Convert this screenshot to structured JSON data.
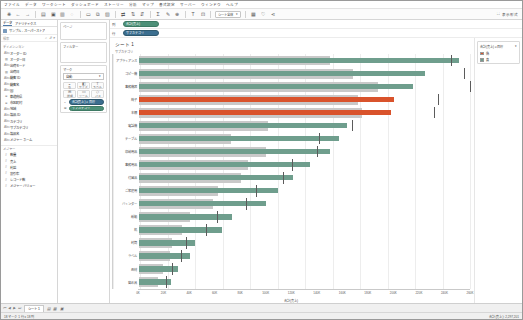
{
  "menu": {
    "items": [
      "ファイル",
      "データ",
      "ワークシート",
      "ダッシュボード",
      "ストーリー",
      "分析",
      "マップ",
      "書式設定",
      "サーバー",
      "ウィンドウ",
      "ヘルプ"
    ]
  },
  "toolbar": {
    "icons": [
      "tableau-logo-icon",
      "back-arrow-icon",
      "forward-arrow-icon",
      "save-icon",
      "add-datasource-icon",
      "refresh-datasource-icon",
      "pause-icon",
      "new-worksheet-icon",
      "duplicate-sheet-icon",
      "clear-sheet-icon",
      "swap-axes-icon",
      "sort-ascending-icon",
      "sort-descending-icon",
      "highlight-icon",
      "group-icon"
    ],
    "fit_label": "シート全体",
    "fit_options": [
      "標準",
      "幅を合わせる",
      "高さを合わせる",
      "シート全体"
    ],
    "presentation_label": "表示形式",
    "presentation_icon": "presentation-icon",
    "share_icon": "share-icon"
  },
  "datapane": {
    "tabs": [
      {
        "label": "データ",
        "active": true
      },
      {
        "label": "アナリティクス",
        "active": false
      }
    ],
    "source_name": "サンプル - スーパーストア",
    "source_icon": "datasource-icon",
    "search_placeholder": "検索",
    "search_icons": [
      "search-icon",
      "sort-field-icon",
      "more-options-icon"
    ],
    "dimensions_header": "ディメンション",
    "dimensions": [
      {
        "icon": "abc",
        "label": "オーダー ID"
      },
      {
        "icon": "cal",
        "label": "オーダー日"
      },
      {
        "icon": "abc",
        "label": "出荷モード"
      },
      {
        "icon": "cal",
        "label": "出荷日"
      },
      {
        "icon": "abc",
        "label": "顧客 ID"
      },
      {
        "icon": "abc",
        "label": "顧客名"
      },
      {
        "icon": "abc",
        "label": "国"
      },
      {
        "icon": "geo",
        "label": "都道府県"
      },
      {
        "icon": "geo",
        "label": "市区町村"
      },
      {
        "icon": "abc",
        "label": "地域"
      },
      {
        "icon": "abc",
        "label": "製品 ID"
      },
      {
        "icon": "abc",
        "label": "カテゴリ"
      },
      {
        "icon": "abc",
        "label": "サブカテゴリ"
      },
      {
        "icon": "abc",
        "label": "製品名"
      },
      {
        "icon": "abc",
        "label": "メジャー ネーム"
      }
    ],
    "measures_header": "メジャー",
    "measures": [
      {
        "icon": "num",
        "label": "数量"
      },
      {
        "icon": "num",
        "label": "売上"
      },
      {
        "icon": "num",
        "label": "利益"
      },
      {
        "icon": "num",
        "label": "割引率"
      },
      {
        "icon": "num",
        "label": "レコード数"
      },
      {
        "icon": "num",
        "label": "メジャー バリュー"
      }
    ]
  },
  "cards": {
    "pages": {
      "title": "ページ"
    },
    "filters": {
      "title": "フィルター"
    },
    "marks": {
      "title": "マーク",
      "type_label": "自動",
      "type_options": [
        "自動",
        "バー",
        "線",
        "エリア",
        "四角",
        "円",
        "形状",
        "テキスト",
        "マップ",
        "円グラフ",
        "ガント チャート",
        "多角形",
        "密度"
      ],
      "buttons": [
        {
          "name": "color-button",
          "glyph": "◒",
          "label": "色"
        },
        {
          "name": "size-button",
          "glyph": "◧",
          "label": "サイズ"
        },
        {
          "name": "label-button",
          "glyph": "T",
          "label": "ラベル"
        },
        {
          "name": "detail-button",
          "glyph": "⊞",
          "label": "詳細"
        },
        {
          "name": "tooltip-button",
          "glyph": "▭",
          "label": "ツール"
        },
        {
          "name": "path-button",
          "glyph": "◇",
          "label": "パス"
        }
      ],
      "pills": [
        {
          "placeholder_icon": "color-icon",
          "label": "合計(売上) ≥ 目標",
          "color": "blue"
        },
        {
          "placeholder_icon": "detail-icon",
          "label": "サブカテゴリ",
          "color": "green"
        }
      ]
    }
  },
  "shelves": [
    {
      "label": "列",
      "name": "columns-shelf",
      "pills": [
        {
          "label": "合計(売上)",
          "color": "green"
        }
      ]
    },
    {
      "label": "行",
      "name": "rows-shelf",
      "pills": [
        {
          "label": "サブカテゴリ",
          "color": "blue"
        }
      ]
    }
  ],
  "worksheet": {
    "title": "シート 1",
    "row_header": "サブカテゴリ"
  },
  "legend": {
    "title": "合計(売上) ≥ 目標",
    "items": [
      {
        "label": "偽",
        "color": "#d9532c"
      },
      {
        "label": "真",
        "color": "#6f9e8d"
      }
    ]
  },
  "tabbar": {
    "nav_icons": [
      "first-sheet-icon",
      "prev-sheet-icon",
      "next-sheet-icon",
      "last-sheet-icon"
    ],
    "tabs": [
      {
        "label": "シート 1",
        "active": true
      }
    ],
    "new_icons": [
      "new-worksheet-icon",
      "new-dashboard-icon",
      "new-story-icon"
    ]
  },
  "statusbar": {
    "left": "18 マーク   1 行 x 18 列",
    "right": "合計(売上): 2,297,201"
  },
  "caption": "図2-36 作成したブレットチャート",
  "colors": {
    "bar_pass": "#6f9e8d",
    "bar_fail": "#d9532c",
    "reference_band": "#c9c9c9",
    "reference_line": "#5b5b5b",
    "accent_green": "#4d9078",
    "accent_blue": "#3b6e8f"
  },
  "chart_data": {
    "type": "bar",
    "title": "シート 1",
    "subtype": "bullet",
    "xlabel": "合計(売上)",
    "ylabel": "サブカテゴリ",
    "xlim": [
      0,
      260000
    ],
    "grid": true,
    "legend_position": "right",
    "axis_ticks": [
      0,
      20000,
      40000,
      60000,
      80000,
      100000,
      120000,
      140000,
      160000,
      180000,
      200000,
      220000,
      240000,
      260000
    ],
    "axis_tick_labels": [
      "0K",
      "20K",
      "40K",
      "60K",
      "80K",
      "100K",
      "120K",
      "140K",
      "160K",
      "180K",
      "200K",
      "220K",
      "240K",
      "260K"
    ],
    "categories": [
      "アプライアンス",
      "コピー機",
      "事務機器",
      "椅子",
      "本棚",
      "電話機",
      "テーブル",
      "収納用品",
      "事務用品",
      "付属品",
      "ご家庭用",
      "バインダー",
      "紙類",
      "机",
      "封筒",
      "ラベル",
      "画材",
      "留め具"
    ],
    "series": [
      {
        "name": "合計(売上)",
        "values": [
          251000,
          225000,
          215000,
          200000,
          198000,
          163000,
          157000,
          150000,
          134000,
          121000,
          109000,
          100000,
          73000,
          65000,
          44000,
          40000,
          31000,
          25000
        ]
      },
      {
        "name": "参照バンド(目標の60%)",
        "values": [
          150000,
          168000,
          188000,
          172000,
          175000,
          101000,
          72000,
          100000,
          86000,
          80000,
          62000,
          58000,
          40000,
          34000,
          26000,
          24000,
          19000,
          15000
        ]
      },
      {
        "name": "目標(参照線)",
        "values": [
          245000,
          255000,
          260000,
          235000,
          232000,
          167000,
          141000,
          140000,
          120000,
          113000,
          92000,
          84000,
          61000,
          53000,
          37000,
          33000,
          26000,
          21000
        ]
      }
    ],
    "pass_flags": [
      true,
      true,
      true,
      false,
      false,
      true,
      true,
      true,
      true,
      true,
      true,
      true,
      true,
      true,
      true,
      true,
      true,
      true
    ]
  }
}
